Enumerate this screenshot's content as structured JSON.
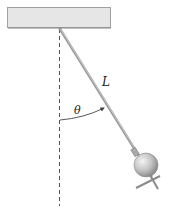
{
  "diagram": {
    "type": "pendulum",
    "labels": {
      "length": "L",
      "angle": "θ"
    },
    "colors": {
      "ceiling_fill": "#e6e6e6",
      "ceiling_stroke": "#9a9a9a",
      "rod": "#9a9a9a",
      "dashed_line": "#555555",
      "arc": "#444444"
    }
  }
}
